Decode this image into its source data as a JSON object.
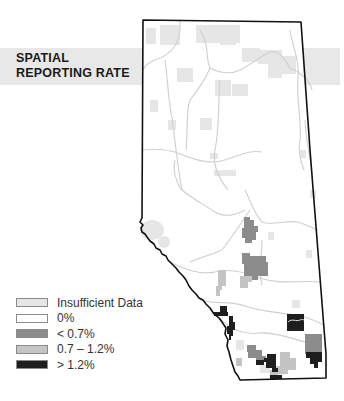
{
  "title": {
    "line1": "SPATIAL",
    "line2": "REPORTING RATE"
  },
  "legend": {
    "items": [
      {
        "label": "Insufficient Data",
        "color": "#e6e6e6"
      },
      {
        "label": "0%",
        "color": "#ffffff"
      },
      {
        "label": "< 0.7%",
        "color": "#8c8c8c"
      },
      {
        "label": "0.7 – 1.2%",
        "color": "#c4c4c4"
      },
      {
        "label": "> 1.2%",
        "color": "#1e1e1e"
      }
    ]
  },
  "colors": {
    "banner": "#e8e8e8",
    "border": "#111111",
    "rivers": "#cfcfcf",
    "insufficient": "#e6e6e6",
    "low": "#8c8c8c",
    "mid": "#c4c4c4",
    "high": "#1e1e1e"
  }
}
